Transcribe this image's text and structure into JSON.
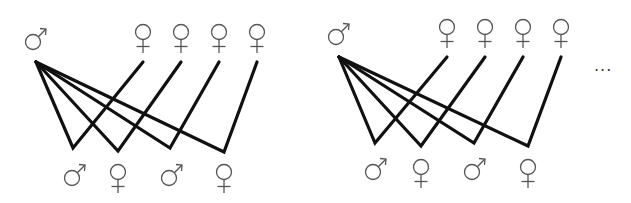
{
  "diagram": {
    "colors": {
      "edges": "#111111",
      "symbols": "#555555",
      "background": "#ffffff"
    },
    "symbols": {
      "male": "male-symbol (♂)",
      "female": "female-symbol (♀)"
    },
    "panels": [
      {
        "id": "left",
        "top_parent": "male",
        "top_partners": [
          "female",
          "female",
          "female",
          "female"
        ],
        "offspring": [
          "male",
          "female",
          "male",
          "female"
        ]
      },
      {
        "id": "right",
        "top_parent": "male",
        "top_partners": [
          "female",
          "female",
          "female",
          "female"
        ],
        "offspring": [
          "male",
          "female",
          "male",
          "female"
        ]
      }
    ],
    "continuation": "..."
  }
}
